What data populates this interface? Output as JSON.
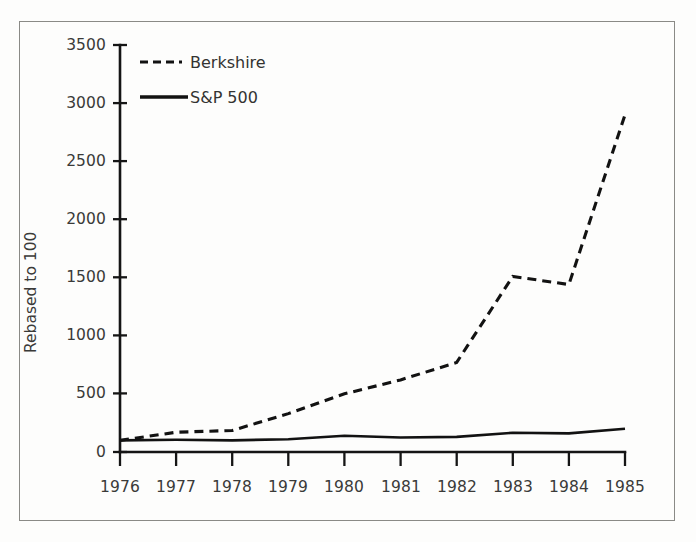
{
  "chart_data": {
    "type": "line",
    "title": "",
    "subtitle": "",
    "xlabel": "",
    "ylabel": "Rebased to 100",
    "x": [
      1976,
      1977,
      1978,
      1979,
      1980,
      1981,
      1982,
      1983,
      1984,
      1985
    ],
    "xtick_labels": [
      "1976",
      "1977",
      "1978",
      "1979",
      "1980",
      "1981",
      "1982",
      "1983",
      "1984",
      "1985"
    ],
    "ytick_labels": [
      "0",
      "500",
      "1000",
      "1500",
      "2000",
      "2500",
      "3000",
      "3500"
    ],
    "yticks": [
      0,
      500,
      1000,
      1500,
      2000,
      2500,
      3000,
      3500
    ],
    "xlim": [
      1976,
      1985
    ],
    "ylim": [
      0,
      3500
    ],
    "grid": false,
    "legend_position": "top-left",
    "series": [
      {
        "name": "Berkshire",
        "style": "dashed",
        "color": "#121212",
        "values": [
          100,
          170,
          185,
          330,
          500,
          620,
          770,
          1510,
          1440,
          2900
        ]
      },
      {
        "name": "S&P 500",
        "style": "solid",
        "color": "#121212",
        "values": [
          100,
          105,
          100,
          110,
          140,
          125,
          130,
          165,
          160,
          200
        ]
      }
    ]
  },
  "legend": {
    "entries": [
      {
        "label": "Berkshire",
        "style": "dashed"
      },
      {
        "label": "S&P 500",
        "style": "solid"
      }
    ]
  },
  "axes": {
    "y_title": "Rebased to 100"
  },
  "colors": {
    "ink": "#121212",
    "axis": "#151515",
    "text": "#3a3a38",
    "frame": "#8a8a86",
    "paper": "#fdfdfc"
  }
}
